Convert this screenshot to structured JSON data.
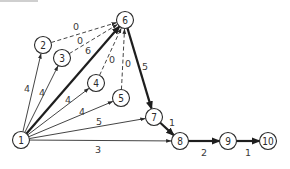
{
  "diagram": {
    "type": "activity-network",
    "nodes": [
      {
        "id": "1",
        "label": "1",
        "x": 21,
        "y": 140
      },
      {
        "id": "2",
        "label": "2",
        "x": 43,
        "y": 45
      },
      {
        "id": "3",
        "label": "3",
        "x": 62,
        "y": 58
      },
      {
        "id": "4",
        "label": "4",
        "x": 96,
        "y": 83
      },
      {
        "id": "5",
        "label": "5",
        "x": 121,
        "y": 98
      },
      {
        "id": "6",
        "label": "6",
        "x": 125,
        "y": 20
      },
      {
        "id": "7",
        "label": "7",
        "x": 154,
        "y": 117
      },
      {
        "id": "8",
        "label": "8",
        "x": 180,
        "y": 141
      },
      {
        "id": "9",
        "label": "9",
        "x": 228,
        "y": 141
      },
      {
        "id": "10",
        "label": "10",
        "x": 268,
        "y": 141
      }
    ],
    "edges": [
      {
        "from": "1",
        "to": "2",
        "weight": "4",
        "style": "normal",
        "label_x": 27,
        "label_y": 88
      },
      {
        "from": "1",
        "to": "3",
        "weight": "4",
        "style": "normal",
        "label_x": 42,
        "label_y": 92
      },
      {
        "from": "1",
        "to": "6",
        "weight": "6",
        "style": "critical",
        "label_x": 88,
        "label_y": 50
      },
      {
        "from": "1",
        "to": "4",
        "weight": "4",
        "style": "normal",
        "label_x": 68,
        "label_y": 99
      },
      {
        "from": "1",
        "to": "5",
        "weight": "4",
        "style": "normal",
        "label_x": 82,
        "label_y": 111
      },
      {
        "from": "1",
        "to": "7",
        "weight": "5",
        "style": "normal",
        "label_x": 99,
        "label_y": 121
      },
      {
        "from": "1",
        "to": "8",
        "weight": "3",
        "style": "normal",
        "label_x": 98,
        "label_y": 149
      },
      {
        "from": "2",
        "to": "6",
        "weight": "0",
        "style": "dummy",
        "label_x": 76,
        "label_y": 26
      },
      {
        "from": "3",
        "to": "6",
        "weight": "0",
        "style": "dummy",
        "label_x": 80,
        "label_y": 40
      },
      {
        "from": "4",
        "to": "6",
        "weight": "0",
        "style": "dummy",
        "label_x": 112,
        "label_y": 59
      },
      {
        "from": "5",
        "to": "6",
        "weight": "0",
        "style": "dummy",
        "label_x": 128,
        "label_y": 63
      },
      {
        "from": "6",
        "to": "7",
        "weight": "5",
        "style": "critical",
        "label_x": 145,
        "label_y": 66
      },
      {
        "from": "7",
        "to": "8",
        "weight": "1",
        "style": "critical",
        "label_x": 172,
        "label_y": 122
      },
      {
        "from": "8",
        "to": "9",
        "weight": "2",
        "style": "critical",
        "label_x": 204,
        "label_y": 152
      },
      {
        "from": "9",
        "to": "10",
        "weight": "1",
        "style": "critical",
        "label_x": 248,
        "label_y": 152
      }
    ],
    "critical_path": [
      "1",
      "6",
      "7",
      "8",
      "9",
      "10"
    ],
    "colors": {
      "stroke": "#2f2f2f",
      "background": "#ffffff"
    }
  }
}
